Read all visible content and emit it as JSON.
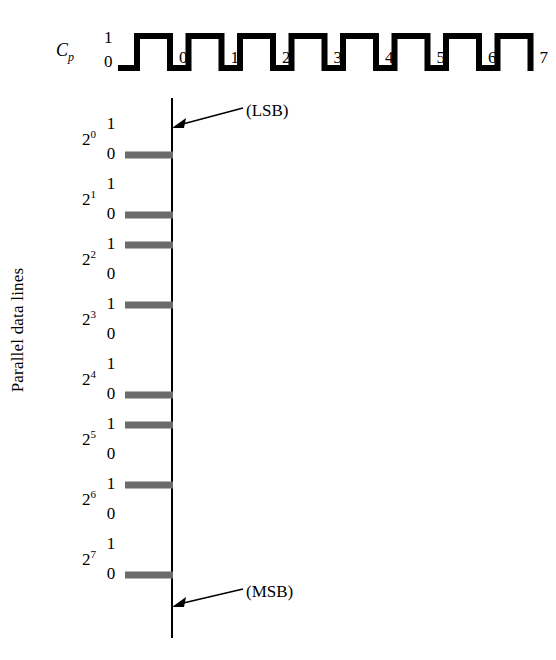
{
  "figure": {
    "axis_caption": "Parallel data lines",
    "background_color": "#ffffff",
    "line_color": "#000000",
    "bar_color": "#6b6b6b"
  },
  "clock": {
    "signal_label": "C",
    "signal_subscript": "p",
    "high_label": "1",
    "low_label": "0",
    "pulse_numbers": [
      "0",
      "1",
      "2",
      "3",
      "4",
      "5",
      "6",
      "7"
    ]
  },
  "annotations": {
    "lsb": "(LSB)",
    "msb": "(MSB)"
  },
  "data_lines": [
    {
      "weight_base": "2",
      "weight_exponent": "0",
      "high_label": "1",
      "low_label": "0",
      "value": "0"
    },
    {
      "weight_base": "2",
      "weight_exponent": "1",
      "high_label": "1",
      "low_label": "0",
      "value": "0"
    },
    {
      "weight_base": "2",
      "weight_exponent": "2",
      "high_label": "1",
      "low_label": "0",
      "value": "1"
    },
    {
      "weight_base": "2",
      "weight_exponent": "3",
      "high_label": "1",
      "low_label": "0",
      "value": "1"
    },
    {
      "weight_base": "2",
      "weight_exponent": "4",
      "high_label": "1",
      "low_label": "0",
      "value": "0"
    },
    {
      "weight_base": "2",
      "weight_exponent": "5",
      "high_label": "1",
      "low_label": "0",
      "value": "1"
    },
    {
      "weight_base": "2",
      "weight_exponent": "6",
      "high_label": "1",
      "low_label": "0",
      "value": "1"
    },
    {
      "weight_base": "2",
      "weight_exponent": "7",
      "high_label": "1",
      "low_label": "0",
      "value": "0"
    }
  ],
  "chart_data": {
    "type": "line",
    "title": "",
    "xlabel": "",
    "ylabel": "Parallel data lines",
    "grid": false,
    "legend": "none",
    "series": [
      {
        "name": "Cp",
        "description": "clock pulse train, 8 pulses labelled 0-7",
        "values": [
          0,
          1,
          0,
          1,
          0,
          1,
          0,
          1,
          0,
          1,
          0,
          1,
          0,
          1,
          0,
          1,
          0
        ],
        "pulse_labels": [
          "0",
          "1",
          "2",
          "3",
          "4",
          "5",
          "6",
          "7"
        ]
      },
      {
        "name": "2^0",
        "values": [
          0
        ]
      },
      {
        "name": "2^1",
        "values": [
          0
        ]
      },
      {
        "name": "2^2",
        "values": [
          1
        ]
      },
      {
        "name": "2^3",
        "values": [
          1
        ]
      },
      {
        "name": "2^4",
        "values": [
          0
        ]
      },
      {
        "name": "2^5",
        "values": [
          1
        ]
      },
      {
        "name": "2^6",
        "values": [
          1
        ]
      },
      {
        "name": "2^7",
        "values": [
          0
        ]
      }
    ],
    "annotations": [
      "(LSB)",
      "(MSB)"
    ]
  }
}
